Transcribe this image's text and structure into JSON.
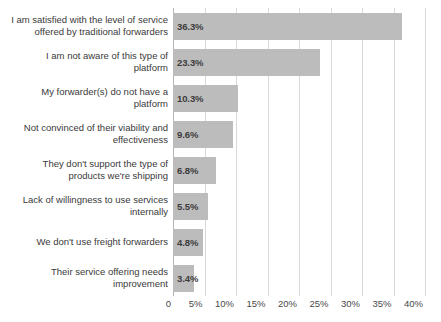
{
  "chart_data": {
    "type": "bar",
    "orientation": "horizontal",
    "title": "",
    "subtitle": "",
    "xlabel": "",
    "ylabel": "",
    "xlim": [
      0,
      40
    ],
    "grid": true,
    "legend": null,
    "bar_color": "#bcbcbc",
    "gridline_color": "#d8d8d8",
    "label_color": "#3a3a3a",
    "background": "#ffffff",
    "categories": [
      "I am satisfied with the level of service\noffered by traditional forwarders",
      "I am not aware of this type of\nplatform",
      "My forwarder(s) do not have a\nplatform",
      "Not convinced of their viability and\neffectiveness",
      "They don't support the type of\nproducts we're shipping",
      "Lack of willingness to use services\ninternally",
      "We don't use freight forwarders",
      "Their service offering needs\nimprovement"
    ],
    "values": [
      36.3,
      23.3,
      10.3,
      9.6,
      6.8,
      5.5,
      4.8,
      3.4
    ],
    "value_labels": [
      "36.3%",
      "23.3%",
      "10.3%",
      "9.6%",
      "6.8%",
      "5.5%",
      "4.8%",
      "3.4%"
    ],
    "xticks": [
      0,
      5,
      10,
      15,
      20,
      25,
      30,
      35,
      40
    ],
    "xticklabels": [
      "0",
      "5%",
      "10%",
      "15%",
      "20%",
      "25%",
      "30%",
      "35%",
      "40%"
    ]
  }
}
